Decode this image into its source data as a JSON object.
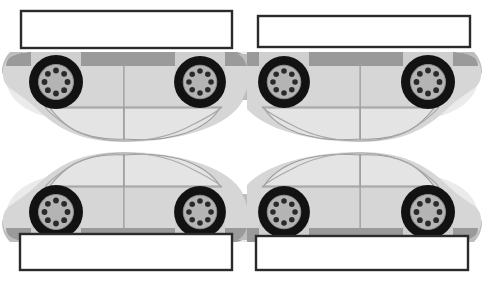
{
  "figure": {
    "name": "car-between-two-plates-diagram",
    "background_color": "#ffffff",
    "width": 495,
    "height": 294,
    "panel_count": 2
  },
  "colors": {
    "background": "#ffffff",
    "plate_fill": "#ffffff",
    "plate_stroke": "#2b2b2b",
    "body_light": "#d6d6d6",
    "body_mid": "#cfcfcf",
    "body_shadow": "#bdbdbd",
    "rocker_dark": "#9a9a9a",
    "rocker_darker": "#8a8a8a",
    "glass": "#e4e4e4",
    "outline": "#9c9c9c",
    "tire_black": "#121212",
    "hub_gray": "#b4b4b4",
    "hub_hole": "#2a2a2a",
    "halo": "#ebebeb"
  },
  "panels": [
    {
      "id": "panel-left",
      "name": "left-panel",
      "facing": "left",
      "top_plate": {
        "name": "top-plate",
        "x": 21,
        "y": 11,
        "width": 211,
        "height": 37,
        "fill": "#ffffff",
        "stroke": "#2b2b2b",
        "stroke_width": 2.4,
        "label": ""
      },
      "bottom_plate": {
        "name": "bottom-plate",
        "x": 20,
        "y": 234,
        "width": 212,
        "height": 36,
        "fill": "#ffffff",
        "stroke": "#2b2b2b",
        "stroke_width": 2.4,
        "label": ""
      },
      "upper_car": {
        "name": "upper-car-inverted",
        "orientation": "inverted",
        "roofline_y": 146,
        "front_wheel": {
          "cx": 56,
          "cy": 79,
          "r_tire": 27,
          "r_hub": 17,
          "holes": 8
        },
        "rear_wheel": {
          "cx": 200,
          "cy": 79,
          "r_tire": 26,
          "r_hub": 16,
          "holes": 8
        }
      },
      "lower_car": {
        "name": "lower-car-upright",
        "orientation": "upright",
        "roofline_y": 148,
        "front_wheel": {
          "cx": 56,
          "cy": 212,
          "r_tire": 27,
          "r_hub": 17,
          "holes": 8
        },
        "rear_wheel": {
          "cx": 200,
          "cy": 212,
          "r_tire": 26,
          "r_hub": 16,
          "holes": 8
        }
      }
    },
    {
      "id": "panel-right",
      "name": "right-panel",
      "facing": "right",
      "top_plate": {
        "name": "top-plate",
        "x": 11,
        "y": 16,
        "width": 212,
        "height": 31,
        "fill": "#ffffff",
        "stroke": "#2b2b2b",
        "stroke_width": 2.4,
        "label": ""
      },
      "bottom_plate": {
        "name": "bottom-plate",
        "x": 9,
        "y": 236,
        "width": 212,
        "height": 34,
        "fill": "#ffffff",
        "stroke": "#2b2b2b",
        "stroke_width": 2.4,
        "label": ""
      },
      "upper_car": {
        "name": "upper-car-inverted",
        "orientation": "inverted",
        "roofline_y": 146,
        "front_wheel": {
          "cx": 190,
          "cy": 79,
          "r_tire": 27,
          "r_hub": 17,
          "holes": 8
        },
        "rear_wheel": {
          "cx": 46,
          "cy": 79,
          "r_tire": 26,
          "r_hub": 16,
          "holes": 8
        }
      },
      "lower_car": {
        "name": "lower-car-upright",
        "orientation": "upright",
        "roofline_y": 148,
        "front_wheel": {
          "cx": 190,
          "cy": 212,
          "r_tire": 27,
          "r_hub": 17,
          "holes": 8
        },
        "rear_wheel": {
          "cx": 46,
          "cy": 212,
          "r_tire": 26,
          "r_hub": 16,
          "holes": 8
        }
      }
    }
  ],
  "annotations": {
    "top_plate_text": "",
    "bottom_plate_text": "",
    "caption": ""
  }
}
